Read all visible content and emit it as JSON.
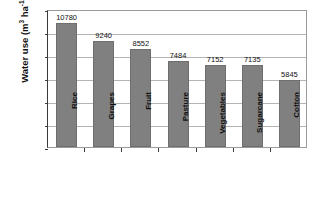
{
  "chart_data": {
    "type": "bar",
    "title": "",
    "xlabel": "",
    "ylabel": "Water use (m3 ha-1)",
    "ylabel_parts": {
      "text_a": "Water use (m",
      "sup_a": "3",
      "text_b": " ha",
      "sup_b": "-1",
      "text_c": ")"
    },
    "categories": [
      "Rice",
      "Grapes",
      "Fruit",
      "Pasture",
      "Vegetables",
      "Sugarcane",
      "Cotton"
    ],
    "values": [
      10780,
      9240,
      8552,
      7484,
      7152,
      7135,
      5845
    ],
    "value_labels": [
      "10780",
      "9240",
      "8552",
      "7484",
      "7152",
      "7135",
      "5845"
    ],
    "ylim": [
      0,
      12000
    ],
    "ytick_values": [
      12000,
      10000,
      8000,
      6000,
      4000,
      2000,
      0
    ],
    "ytick_labels": [
      "12000",
      "10000",
      "8000",
      "6000",
      "4000",
      "2000",
      "0"
    ],
    "grid": true,
    "grid_axis": "y",
    "legend": null,
    "legend_position": "none",
    "bar_color": "#808080",
    "bar_edge_color": "#6e6e6e",
    "grid_color": "#b4b4b4",
    "axis_color": "#3a3a3a",
    "plot_background": "#ffffff",
    "figure_background": "#ffffff"
  }
}
